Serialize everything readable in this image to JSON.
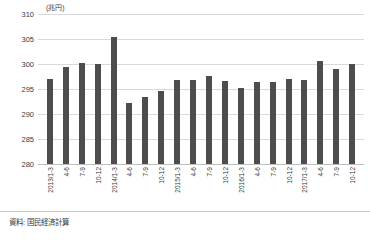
{
  "chart_data": {
    "type": "bar",
    "title": "",
    "subtitle": "",
    "unit_label": "(兆円)",
    "xlabel": "",
    "ylabel": "",
    "ylim": [
      280,
      310
    ],
    "yticks": [
      280,
      285,
      290,
      295,
      300,
      305,
      310
    ],
    "grid": true,
    "legend": null,
    "bar_color": "#4d4d4d",
    "categories": [
      "2013/1-3",
      "4-6",
      "7-9",
      "10-12",
      "2014/1-3",
      "4-6",
      "7-9",
      "10-12",
      "2015/1-3",
      "4-6",
      "7-9",
      "10-12",
      "2016/1-3",
      "4-6",
      "7-9",
      "10-12",
      "2017/1-3",
      "4-6",
      "7-9",
      "10-12"
    ],
    "values": [
      297.0,
      299.5,
      300.3,
      300.0,
      305.5,
      292.2,
      293.4,
      294.7,
      296.8,
      296.9,
      297.6,
      296.6,
      295.2,
      296.4,
      296.4,
      297.1,
      296.9,
      300.7,
      299.1,
      300.1
    ]
  },
  "footer": {
    "source_note": "資料: 国民経済計算"
  }
}
